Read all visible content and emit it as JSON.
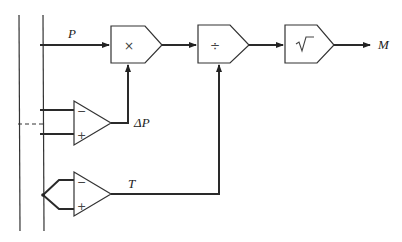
{
  "diagram": {
    "type": "flow-meter signal computation block diagram",
    "signals": {
      "pressure": "P",
      "differential_pressure": "ΔP",
      "temperature": "T",
      "output": "M"
    },
    "blocks": [
      {
        "id": "multiply",
        "symbol": "×"
      },
      {
        "id": "divide",
        "symbol": "÷"
      },
      {
        "id": "sqrt",
        "symbol": "√‾"
      }
    ],
    "amplifiers": [
      {
        "id": "dp-amplifier",
        "inputs": [
          "−",
          "+"
        ],
        "output": "ΔP"
      },
      {
        "id": "temperature-amplifier",
        "inputs": [
          "−",
          "+"
        ],
        "output": "T"
      }
    ]
  }
}
